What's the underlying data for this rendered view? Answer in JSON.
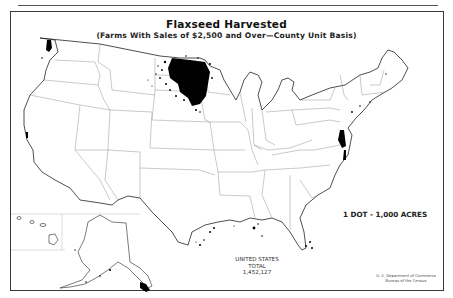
{
  "map": {
    "title": "Flaxseed Harvested",
    "subtitle": "(Farms With Sales of $2,500 and Over—County Unit Basis)",
    "legend": "1 DOT - 1,000 ACRES",
    "total": {
      "line1": "UNITED STATES",
      "line2": "TOTAL",
      "value": "1,452,127"
    },
    "credit": {
      "line1": "U. S. Department of Commerce",
      "line2": "Bureau of the Census"
    },
    "colors": {
      "ink": "#111111",
      "boundary": "#777777",
      "background": "#ffffff"
    },
    "regions_with_dots": [
      "North Dakota",
      "South Dakota (northeast)",
      "Minnesota (west)",
      "Montana (northeast, sparse)",
      "Washington (coast)",
      "California (coast)",
      "Texas (Gulf coast)",
      "Louisiana (coast)",
      "Florida (coast)",
      "Atlantic coast (MD/VA/NC)",
      "Alaska (southeast)"
    ]
  }
}
